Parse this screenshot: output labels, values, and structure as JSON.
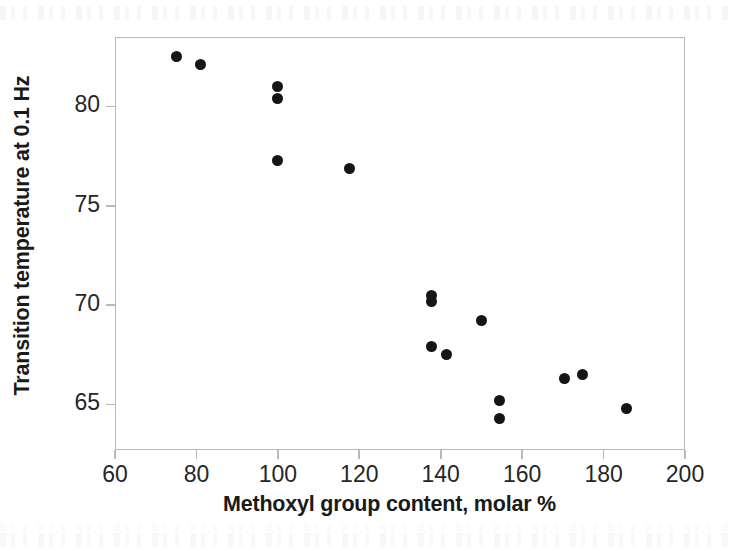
{
  "figure": {
    "width": 733,
    "height": 551,
    "background": "#ffffff",
    "marker_color": "#151515",
    "axis_color": "#b9b9b9",
    "text_color": "#262626"
  },
  "chart_data": {
    "type": "scatter",
    "title": "",
    "xlabel": "Methoxyl group content, molar %",
    "ylabel": "Transition temperature at 0.1 Hz",
    "xlim": [
      60,
      200
    ],
    "ylim": [
      62.7,
      83.5
    ],
    "xticks": [
      60,
      80,
      100,
      120,
      140,
      160,
      180,
      200
    ],
    "yticks": [
      65,
      70,
      75,
      80
    ],
    "xticklabels": [
      "60",
      "80",
      "100",
      "120",
      "140",
      "160",
      "180",
      "200"
    ],
    "yticklabels": [
      "65",
      "70",
      "75",
      "80"
    ],
    "grid": false,
    "legend": null,
    "marker": "filled-circle",
    "points": [
      {
        "x": 75.0,
        "y": 82.5
      },
      {
        "x": 81.0,
        "y": 82.1
      },
      {
        "x": 100.0,
        "y": 81.0
      },
      {
        "x": 100.0,
        "y": 80.4
      },
      {
        "x": 100.0,
        "y": 77.3
      },
      {
        "x": 117.5,
        "y": 76.9
      },
      {
        "x": 137.7,
        "y": 70.5
      },
      {
        "x": 137.7,
        "y": 70.2
      },
      {
        "x": 137.7,
        "y": 67.9
      },
      {
        "x": 141.4,
        "y": 67.5
      },
      {
        "x": 150.0,
        "y": 69.2
      },
      {
        "x": 154.4,
        "y": 65.2
      },
      {
        "x": 154.4,
        "y": 64.3
      },
      {
        "x": 170.4,
        "y": 66.3
      },
      {
        "x": 174.8,
        "y": 66.5
      },
      {
        "x": 185.6,
        "y": 64.8
      }
    ]
  }
}
